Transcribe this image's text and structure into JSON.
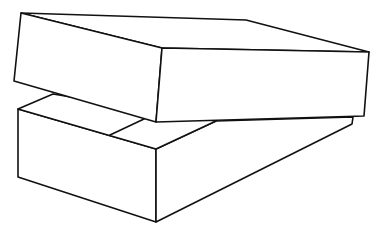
{
  "illustration": {
    "subject": "open box with lid resting askew on top",
    "style": "black line drawing on white",
    "colors": {
      "background": "#ffffff",
      "stroke": "#111111"
    },
    "box_base": {
      "top_face": [
        [
          18,
          109
        ],
        [
          53,
          94
        ],
        [
          216,
          121
        ],
        [
          156,
          149
        ]
      ],
      "front_left_face": [
        [
          18,
          109
        ],
        [
          156,
          149
        ],
        [
          156,
          222
        ],
        [
          18,
          177
        ]
      ],
      "right_face": [
        [
          156,
          149
        ],
        [
          216,
          121
        ],
        [
          353,
          117
        ],
        [
          352,
          124
        ],
        [
          156,
          222
        ]
      ],
      "inner_divider": [
        [
          110,
          135
        ],
        [
          144,
          119
        ]
      ]
    },
    "lid": {
      "top_face": [
        [
          21,
          13
        ],
        [
          246,
          20
        ],
        [
          369,
          52
        ],
        [
          162,
          48
        ]
      ],
      "left_face": [
        [
          21,
          13
        ],
        [
          162,
          48
        ],
        [
          156,
          122
        ],
        [
          14,
          81
        ]
      ],
      "front_face": [
        [
          162,
          48
        ],
        [
          369,
          52
        ],
        [
          364,
          116
        ],
        [
          156,
          122
        ]
      ]
    }
  }
}
